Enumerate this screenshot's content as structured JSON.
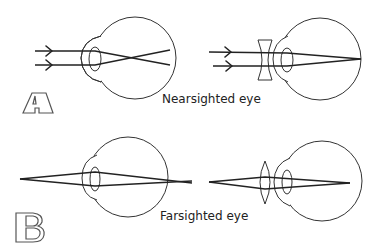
{
  "panels": [
    {
      "letter": "A",
      "caption": "Nearsighted eye",
      "eyes": [
        {
          "condition": "uncorrected",
          "corrective_lens": "none",
          "focus": "in front of retina"
        },
        {
          "condition": "corrected",
          "corrective_lens": "concave",
          "focus": "on retina"
        }
      ]
    },
    {
      "letter": "B",
      "caption": "Farsighted eye",
      "eyes": [
        {
          "condition": "uncorrected",
          "corrective_lens": "none",
          "focus": "behind retina"
        },
        {
          "condition": "corrected",
          "corrective_lens": "convex",
          "focus": "on retina"
        }
      ]
    }
  ],
  "colors": {
    "line": "#222222",
    "background": "#ffffff"
  }
}
